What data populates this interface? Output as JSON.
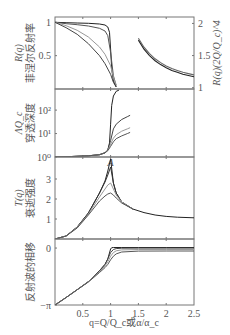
{
  "chart_data": [
    {
      "type": "line",
      "panel": "reflectivity",
      "ylabel_lines": [
        "R(q)",
        "菲涅尔反射率"
      ],
      "ylabel_right": "R(q)(2Q/Q_c)^4",
      "yticks_left": [
        {
          "v": 1,
          "label": "1"
        },
        {
          "v": 0.5,
          "label": "0.5"
        }
      ],
      "yticks_right": [
        {
          "v": 2,
          "label": "2"
        },
        {
          "v": 1.5,
          "label": "1.5"
        },
        {
          "v": 1,
          "label": "1"
        }
      ],
      "ylim_left": [
        0,
        1.08
      ],
      "ylim_right": [
        0.98,
        2.1
      ],
      "series": [
        {
          "name": "curve-1",
          "color": "#222222",
          "x": [
            0,
            0.2,
            0.4,
            0.6,
            0.8,
            0.9,
            0.95,
            0.98,
            1.0,
            1.02,
            1.05,
            1.1
          ],
          "y": [
            1,
            0.995,
            0.99,
            0.985,
            0.975,
            0.96,
            0.93,
            0.85,
            0.6,
            0.3,
            0.12,
            0.03
          ]
        },
        {
          "name": "curve-2",
          "color": "#555555",
          "x": [
            0,
            0.2,
            0.4,
            0.6,
            0.8,
            0.9,
            0.95,
            1.0,
            1.05,
            1.1
          ],
          "y": [
            1,
            0.98,
            0.965,
            0.945,
            0.91,
            0.87,
            0.8,
            0.55,
            0.2,
            0.05
          ]
        },
        {
          "name": "curve-3",
          "color": "#999999",
          "x": [
            0,
            0.2,
            0.4,
            0.6,
            0.8,
            0.9,
            1.0,
            1.05,
            1.1
          ],
          "y": [
            1,
            0.95,
            0.88,
            0.78,
            0.63,
            0.52,
            0.35,
            0.18,
            0.06
          ]
        },
        {
          "name": "curve-4",
          "color": "#444444",
          "x": [
            0,
            0.2,
            0.4,
            0.6,
            0.8,
            0.9,
            1.0,
            1.05,
            1.1
          ],
          "y": [
            1,
            0.92,
            0.82,
            0.68,
            0.5,
            0.38,
            0.22,
            0.1,
            0.03
          ]
        }
      ],
      "right_series": [
        {
          "name": "normalized-1",
          "color": "#222222",
          "x": [
            1.5,
            1.6,
            1.7,
            1.8,
            1.9,
            2.0,
            2.1,
            2.2,
            2.3,
            2.4,
            2.5
          ],
          "y": [
            1.74,
            1.6,
            1.5,
            1.42,
            1.36,
            1.31,
            1.27,
            1.24,
            1.21,
            1.19,
            1.17
          ]
        },
        {
          "name": "normalized-2",
          "color": "#666666",
          "x": [
            1.5,
            1.6,
            1.7,
            1.8,
            1.9,
            2.0,
            2.1,
            2.2,
            2.3,
            2.4,
            2.5
          ],
          "y": [
            1.77,
            1.63,
            1.53,
            1.45,
            1.39,
            1.34,
            1.3,
            1.27,
            1.24,
            1.22,
            1.2
          ]
        }
      ]
    },
    {
      "type": "line",
      "panel": "penetration-depth",
      "yscale": "log",
      "ylabel_lines": [
        "ΛQ_c",
        "穿透深度"
      ],
      "yticks_left": [
        {
          "v": 2,
          "label": "10²"
        },
        {
          "v": 1,
          "label": "10¹"
        },
        {
          "v": 0,
          "label": "10⁰"
        }
      ],
      "ylim_log10": [
        0,
        2.9
      ],
      "series": [
        {
          "name": "curve-1",
          "color": "#222222",
          "x": [
            0,
            0.3,
            0.6,
            0.8,
            0.9,
            0.95,
            0.98,
            1.0,
            1.02,
            1.05,
            1.1,
            1.15
          ],
          "y": [
            0.0,
            0.02,
            0.05,
            0.1,
            0.18,
            0.3,
            0.6,
            1.4,
            2.2,
            2.6,
            2.8,
            2.85
          ]
        },
        {
          "name": "curve-2",
          "color": "#444444",
          "x": [
            0,
            0.3,
            0.6,
            0.8,
            0.9,
            0.95,
            1.0,
            1.05,
            1.1,
            1.2,
            1.3,
            1.35
          ],
          "y": [
            0.0,
            0.02,
            0.05,
            0.1,
            0.18,
            0.3,
            0.7,
            1.2,
            1.4,
            1.6,
            1.72,
            1.78
          ]
        },
        {
          "name": "curve-3",
          "color": "#999999",
          "x": [
            0,
            0.3,
            0.6,
            0.8,
            0.9,
            0.95,
            1.0,
            1.05,
            1.1,
            1.2,
            1.3,
            1.35
          ],
          "y": [
            0.0,
            0.02,
            0.05,
            0.1,
            0.18,
            0.28,
            0.55,
            0.8,
            0.95,
            1.1,
            1.2,
            1.25
          ]
        },
        {
          "name": "curve-4",
          "color": "#555555",
          "x": [
            0,
            0.3,
            0.6,
            0.8,
            0.9,
            0.95,
            1.0,
            1.05,
            1.1,
            1.2,
            1.3,
            1.35
          ],
          "y": [
            0.0,
            0.02,
            0.05,
            0.1,
            0.18,
            0.27,
            0.45,
            0.65,
            0.78,
            0.9,
            1.0,
            1.05
          ]
        }
      ],
      "annotation": {
        "label": "A",
        "x": 1.0
      }
    },
    {
      "type": "line",
      "panel": "evanescent-intensity",
      "ylabel_lines": [
        "T(q)",
        "衰逝强度"
      ],
      "yticks_left": [
        {
          "v": 3,
          "label": "3"
        },
        {
          "v": 2,
          "label": "2"
        },
        {
          "v": 1,
          "label": "1"
        }
      ],
      "ylim": [
        0,
        4.1
      ],
      "series": [
        {
          "name": "curve-1",
          "color": "#222222",
          "x": [
            0,
            0.2,
            0.4,
            0.6,
            0.8,
            0.9,
            0.95,
            1.0,
            1.05,
            1.1,
            1.2,
            1.4,
            1.6,
            1.8,
            2.0,
            2.2,
            2.5
          ],
          "y": [
            0,
            0.15,
            0.6,
            1.3,
            2.3,
            2.9,
            3.4,
            4.0,
            2.8,
            2.3,
            1.85,
            1.5,
            1.32,
            1.2,
            1.13,
            1.09,
            1.06
          ]
        },
        {
          "name": "curve-2",
          "color": "#333333",
          "x": [
            0,
            0.2,
            0.4,
            0.6,
            0.8,
            0.9,
            0.95,
            1.0,
            1.05,
            1.1,
            1.2,
            1.4
          ],
          "y": [
            0,
            0.15,
            0.6,
            1.3,
            2.3,
            2.85,
            3.2,
            3.6,
            2.8,
            2.3,
            1.85,
            1.5
          ]
        },
        {
          "name": "curve-3",
          "color": "#999999",
          "x": [
            0,
            0.2,
            0.4,
            0.6,
            0.8,
            0.9,
            0.95,
            1.0,
            1.05,
            1.1,
            1.2,
            1.4
          ],
          "y": [
            0,
            0.15,
            0.58,
            1.25,
            2.1,
            2.5,
            2.7,
            2.8,
            2.5,
            2.2,
            1.85,
            1.5
          ]
        },
        {
          "name": "curve-4",
          "color": "#555555",
          "x": [
            0,
            0.2,
            0.4,
            0.6,
            0.8,
            0.9,
            0.95,
            1.0,
            1.05,
            1.1,
            1.2,
            1.4
          ],
          "y": [
            0,
            0.15,
            0.55,
            1.2,
            1.9,
            2.15,
            2.25,
            2.3,
            2.2,
            2.05,
            1.8,
            1.5
          ]
        }
      ]
    },
    {
      "type": "line",
      "panel": "phase-shift",
      "ylabel_lines": [
        "反射波的相移"
      ],
      "yticks_left": [
        {
          "v": 0,
          "label": "0"
        },
        {
          "v": -3.1416,
          "label": "−π"
        }
      ],
      "ylim": [
        -3.1416,
        0.5
      ],
      "xlabel": "q=Q/Q_c或α/α_c",
      "xticks": [
        {
          "v": 0.5,
          "label": "0.5"
        },
        {
          "v": 1,
          "label": "1"
        },
        {
          "v": 1.5,
          "label": "1.5"
        },
        {
          "v": 2,
          "label": "2"
        },
        {
          "v": 2.5,
          "label": "2.5"
        }
      ],
      "xlim": [
        0,
        2.5
      ],
      "series": [
        {
          "name": "curve-1",
          "color": "#222222",
          "x": [
            0,
            0.2,
            0.4,
            0.6,
            0.8,
            0.9,
            0.95,
            1.0,
            1.02,
            1.05,
            1.2,
            1.5,
            2.0,
            2.5
          ],
          "y": [
            -3.14,
            -2.73,
            -2.3,
            -1.85,
            -1.25,
            -0.9,
            -0.6,
            -0.05,
            0.02,
            0.03,
            0.03,
            0.03,
            0.03,
            0.03
          ]
        },
        {
          "name": "curve-2",
          "color": "#444444",
          "x": [
            0,
            0.2,
            0.4,
            0.6,
            0.8,
            0.9,
            0.95,
            1.0,
            1.05,
            1.1,
            1.2,
            1.5,
            2.0,
            2.5
          ],
          "y": [
            -3.14,
            -2.73,
            -2.3,
            -1.85,
            -1.25,
            -0.9,
            -0.6,
            -0.25,
            -0.08,
            -0.03,
            -0.01,
            0,
            0,
            0
          ]
        },
        {
          "name": "curve-3",
          "color": "#999999",
          "x": [
            0,
            0.2,
            0.4,
            0.6,
            0.8,
            0.9,
            0.95,
            1.0,
            1.05,
            1.1,
            1.2,
            1.5,
            2.0,
            2.5
          ],
          "y": [
            -3.14,
            -2.73,
            -2.3,
            -1.86,
            -1.3,
            -0.98,
            -0.75,
            -0.45,
            -0.25,
            -0.15,
            -0.1,
            -0.08,
            -0.08,
            -0.08
          ]
        },
        {
          "name": "curve-4",
          "color": "#555555",
          "x": [
            0,
            0.2,
            0.4,
            0.6,
            0.8,
            0.9,
            0.95,
            1.0,
            1.05,
            1.1,
            1.2,
            1.5,
            2.0,
            2.5
          ],
          "y": [
            -3.14,
            -2.73,
            -2.3,
            -1.87,
            -1.35,
            -1.08,
            -0.9,
            -0.65,
            -0.45,
            -0.32,
            -0.22,
            -0.17,
            -0.16,
            -0.16
          ]
        }
      ]
    }
  ]
}
